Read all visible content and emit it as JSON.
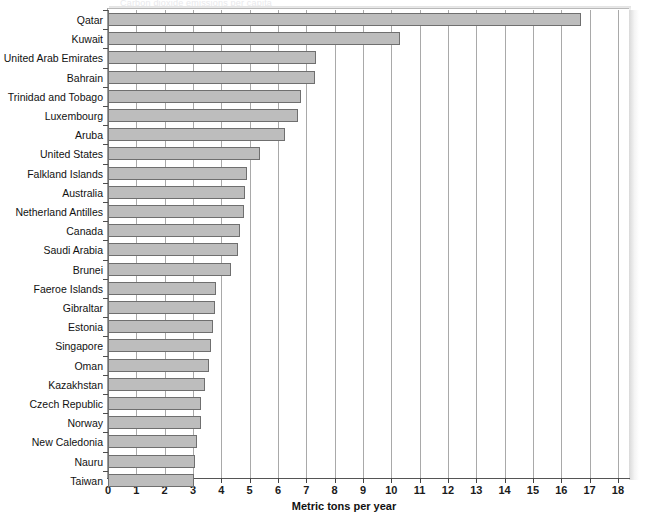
{
  "chart": {
    "type": "bar",
    "orientation": "horizontal",
    "title_ghost": "Carbon dioxide emissions per capita",
    "xlabel": "Metric tons per year",
    "ylabel": "",
    "xlim": [
      0,
      18
    ],
    "xticks": [
      0,
      1,
      2,
      3,
      4,
      5,
      6,
      7,
      8,
      9,
      10,
      11,
      12,
      13,
      14,
      15,
      16,
      17,
      18
    ],
    "xtick_labels": [
      "0",
      "1",
      "2",
      "3",
      "4",
      "5",
      "6",
      "7",
      "8",
      "9",
      "10",
      "11",
      "12",
      "13",
      "14",
      "15",
      "16",
      "17",
      "18"
    ],
    "grid": true,
    "legend": false,
    "bar_fill": "#bdbdbd",
    "bar_edge": "#6f6f6f"
  },
  "chart_data": {
    "type": "bar",
    "title": "",
    "xlabel": "Metric tons per year",
    "ylabel": "",
    "xlim": [
      0,
      18
    ],
    "grid": true,
    "legend_position": "none",
    "categories": [
      "Qatar",
      "Kuwait",
      "United Arab Emirates",
      "Bahrain",
      "Trinidad and Tobago",
      "Luxembourg",
      "Aruba",
      "United States",
      "Falkland Islands",
      "Australia",
      "Netherland Antilles",
      "Canada",
      "Saudi Arabia",
      "Brunei",
      "Faeroe Islands",
      "Gibraltar",
      "Estonia",
      "Singapore",
      "Oman",
      "Kazakhstan",
      "Czech Republic",
      "Norway",
      "New Caledonia",
      "Nauru",
      "Taiwan"
    ],
    "values": [
      16.7,
      10.3,
      7.35,
      7.3,
      6.8,
      6.7,
      6.25,
      5.35,
      4.9,
      4.85,
      4.8,
      4.65,
      4.6,
      4.35,
      3.8,
      3.78,
      3.7,
      3.65,
      3.57,
      3.43,
      3.3,
      3.28,
      3.15,
      3.07,
      3.05
    ]
  }
}
